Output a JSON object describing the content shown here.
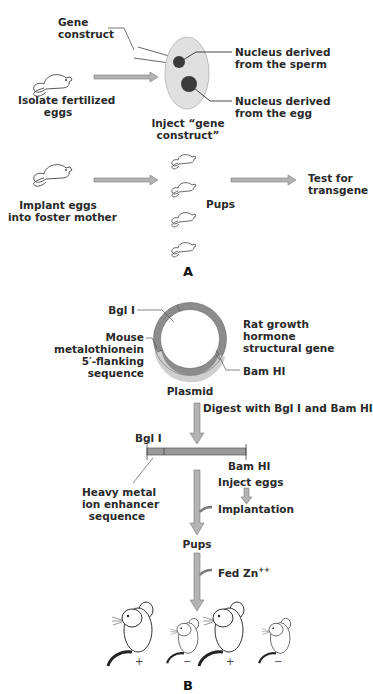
{
  "panel_a": {
    "label": "A",
    "gene_construct": [
      "Gene",
      "construct"
    ],
    "isolate": [
      "Isolate fertilized",
      "eggs"
    ],
    "inject": [
      "Inject “gene",
      "construct”"
    ],
    "nucleus_sperm": [
      "Nucleus derived",
      "from the sperm"
    ],
    "nucleus_egg": [
      "Nucleus derived",
      "from the egg"
    ],
    "implant": [
      "Implant eggs",
      "into foster mother"
    ],
    "pups": "Pups",
    "test": [
      "Test for",
      "transgene"
    ]
  },
  "panel_b": {
    "label": "B",
    "bgl_top": "Bgl I",
    "mouse_mt": [
      "Mouse",
      "metalothionein",
      "5′-flanking",
      "sequence"
    ],
    "rat_gh": [
      "Rat growth",
      "hormone",
      "structural gene"
    ],
    "bam_top": "Bam HI",
    "plasmid": "Plasmid",
    "digest": "Digest with Bgl I and Bam HI",
    "bgl_frag": "Bgl I",
    "bam_frag": "Bam HI",
    "enhancer": [
      "Heavy metal",
      "ion enhancer",
      "sequence"
    ],
    "inject_eggs": "Inject eggs",
    "implantation": "Implantation",
    "pups": "Pups",
    "fed": "Fed Zn",
    "fed_sup": "++",
    "signs": [
      "+",
      "−",
      "+",
      "−"
    ]
  },
  "colors": {
    "arrow": "#b3b3b3",
    "arrow_stroke": "#7a7a7a",
    "egg": "#e0e0e0",
    "nucleus": "#3a3a3a",
    "ring_dark": "#8c8c8c",
    "ring_light": "#cfcfcf"
  }
}
